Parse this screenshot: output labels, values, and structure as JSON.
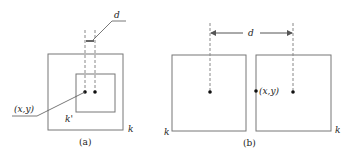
{
  "figure": {
    "panels": [
      {
        "id": "a",
        "caption": "(a)",
        "outer_box_label": "k",
        "inner_box_label": "k'",
        "point_label": "(x,y)",
        "distance_label": "d"
      },
      {
        "id": "b",
        "caption": "(b)",
        "left_box_label": "k",
        "right_box_label": "k",
        "point_label": "(x,y)",
        "distance_label": "d"
      }
    ],
    "colors": {
      "box_stroke": "#777777",
      "dash_stroke": "#888888",
      "dot": "#111111",
      "text": "#222222"
    }
  }
}
